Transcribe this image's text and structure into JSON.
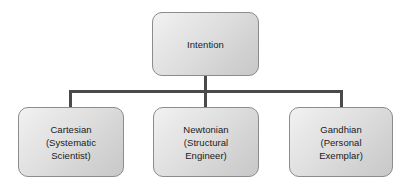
{
  "diagram": {
    "type": "hierarchy-tree",
    "background_color": "#ffffff",
    "node_fill_color": "#dcdcdc",
    "node_border_color": "#8c8c8c",
    "connector_color": "#4a4a4a",
    "text_color": "#1a1a1a",
    "root": {
      "label": "Intention"
    },
    "children": [
      {
        "label": "Cartesian\n(Systematic\nScientist)",
        "title": "Cartesian",
        "subtitle": "(Systematic Scientist)"
      },
      {
        "label": "Newtonian\n(Structural\nEngineer)",
        "title": "Newtonian",
        "subtitle": "(Structural Engineer)"
      },
      {
        "label": "Gandhian\n(Personal\nExemplar)",
        "title": "Gandhian",
        "subtitle": "(Personal Exemplar)"
      }
    ]
  }
}
